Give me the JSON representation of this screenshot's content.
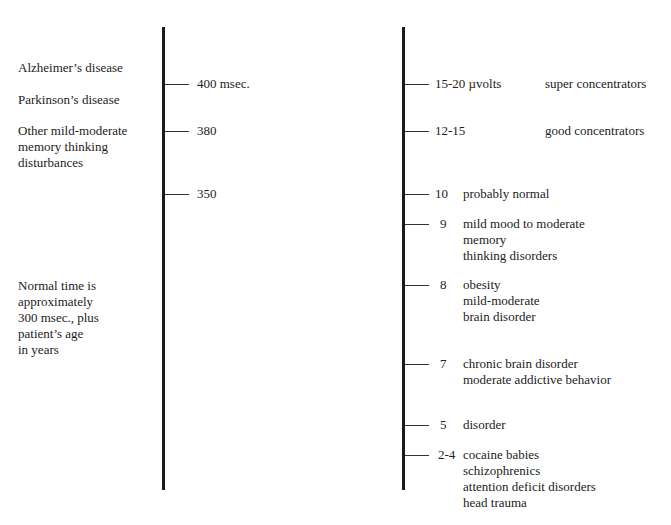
{
  "left_column": {
    "conditions": [
      {
        "lines": [
          "Alzheimer’s disease"
        ]
      },
      {
        "lines": [
          "Parkinson’s disease"
        ]
      },
      {
        "lines": [
          "Other mild-moderate",
          "memory thinking",
          "disturbances"
        ]
      },
      {
        "lines": [
          "Normal time is",
          "approximately",
          "300 msec., plus",
          "patient’s age",
          "in years"
        ]
      }
    ]
  },
  "left_scale": {
    "unit": "msec.",
    "ticks": [
      {
        "label": "400 msec."
      },
      {
        "label": "380"
      },
      {
        "label": "350"
      }
    ]
  },
  "right_scale": {
    "unit": "µvolts",
    "ticks": [
      {
        "value": "15-20 µvolts",
        "lines": [
          "super concentrators"
        ]
      },
      {
        "value": "12-15",
        "lines": [
          "good concentrators"
        ]
      },
      {
        "value": "10",
        "lines": [
          "probably normal"
        ]
      },
      {
        "value": "9",
        "lines": [
          "mild mood to moderate",
          "memory",
          "thinking disorders"
        ]
      },
      {
        "value": "8",
        "lines": [
          "obesity",
          "mild-moderate",
          "brain disorder"
        ]
      },
      {
        "value": "7",
        "lines": [
          "chronic brain disorder",
          "moderate addictive behavior"
        ]
      },
      {
        "value": "5",
        "lines": [
          "disorder"
        ]
      },
      {
        "value": "2-4",
        "lines": [
          "cocaine babies",
          "schizophrenics",
          "attention deficit disorders",
          "head trauma"
        ]
      }
    ]
  }
}
